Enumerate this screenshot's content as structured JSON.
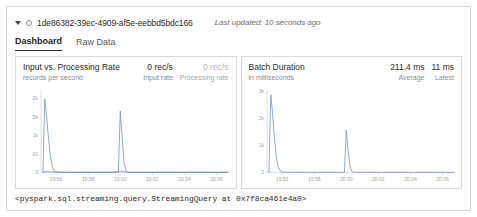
{
  "header": {
    "caret_icon": "chevron-down-icon",
    "status_icon": "status-circle-icon",
    "query_id": "1de86382-39ec-4909-af5e-eebbd5bdc166",
    "last_updated": "Last updated: 10 seconds ago"
  },
  "tabs": [
    {
      "label": "Dashboard",
      "active": true
    },
    {
      "label": "Raw Data",
      "active": false
    }
  ],
  "panels": [
    {
      "title": "Input vs. Processing Rate",
      "subtitle": "records per second",
      "stats": [
        {
          "value": "0 rec/s",
          "label": "Input rate",
          "muted": false
        },
        {
          "value": "0 rec/s",
          "label": "Processing rate",
          "muted": true
        }
      ]
    },
    {
      "title": "Batch Duration",
      "subtitle": "in milliseconds",
      "stats": [
        {
          "value": "211.4 ms",
          "label": "Average",
          "muted": false
        },
        {
          "value": "11 ms",
          "label": "Latest",
          "muted": false
        }
      ]
    }
  ],
  "repr": "<pyspark.sql.streaming.query.StreamingQuery at 0x7f8ca461e4a0>",
  "colors": {
    "input_rate_line": "#6f92c4",
    "processing_rate_line": "#c9ced6",
    "batch_duration_line": "#6f92c4",
    "axis": "#cfcfcf",
    "tick_text": "#a6a6a6",
    "card_border": "#d6d6d6",
    "active_tab_underline": "#2b2b2b"
  },
  "chart_data": [
    {
      "type": "line",
      "name": "input-vs-processing-rate-chart",
      "title": "Input vs. Processing Rate",
      "ylabel": "records per second",
      "xlabel": "",
      "grid": false,
      "legend": "none",
      "xlim": [
        0,
        100
      ],
      "ylim": [
        0,
        2200
      ],
      "xticks": [
        8,
        25,
        42,
        59,
        76,
        93
      ],
      "xticklabels": [
        "19:56",
        "19:58",
        "20:00",
        "20:02",
        "20:04",
        "20:06"
      ],
      "yticks": [
        0,
        500,
        1000,
        1500,
        2000
      ],
      "yticklabels": [
        "0",
        ".00",
        "1k",
        ".5k",
        "2k"
      ],
      "series": [
        {
          "name": "Input rate",
          "color": "#6f92c4",
          "x": [
            1,
            2,
            3,
            4,
            5,
            6,
            7,
            8,
            10,
            14,
            20,
            26,
            32,
            38,
            41,
            42,
            43,
            44,
            45,
            46,
            48,
            52,
            58,
            64,
            70,
            76,
            82,
            88,
            94,
            99
          ],
          "y": [
            0,
            1980,
            1480,
            900,
            430,
            150,
            40,
            8,
            0,
            0,
            0,
            0,
            0,
            0,
            0,
            1650,
            940,
            260,
            40,
            0,
            0,
            0,
            0,
            0,
            0,
            0,
            0,
            0,
            0,
            0
          ]
        },
        {
          "name": "Processing rate",
          "color": "#c9ced6",
          "x": [
            1,
            3,
            5,
            8,
            14,
            20,
            26,
            32,
            38,
            42,
            44,
            46,
            52,
            58,
            64,
            70,
            76,
            82,
            88,
            94,
            99
          ],
          "y": [
            0,
            20,
            12,
            4,
            0,
            0,
            0,
            0,
            0,
            30,
            14,
            0,
            0,
            0,
            0,
            0,
            0,
            0,
            0,
            0,
            0
          ]
        }
      ]
    },
    {
      "type": "line",
      "name": "batch-duration-chart",
      "title": "Batch Duration",
      "ylabel": "in milliseconds",
      "xlabel": "",
      "grid": false,
      "legend": "none",
      "xlim": [
        0,
        100
      ],
      "ylim": [
        0,
        3000
      ],
      "xticks": [
        8,
        25,
        42,
        59,
        76,
        93
      ],
      "xticklabels": [
        "19:56",
        "19:58",
        "20:00",
        "20:02",
        "20:04",
        "20:06"
      ],
      "yticks": [
        0,
        1000,
        2000,
        3000
      ],
      "yticklabels": [
        "0",
        "1k",
        "2k",
        "3k"
      ],
      "series": [
        {
          "name": "Batch duration",
          "color": "#6f92c4",
          "x": [
            1,
            2,
            3,
            4,
            5,
            6,
            7,
            8,
            10,
            14,
            20,
            26,
            32,
            38,
            41,
            42,
            43,
            44,
            45,
            46,
            48,
            52,
            58,
            64,
            70,
            76,
            82,
            88,
            94,
            99
          ],
          "y": [
            0,
            2850,
            2100,
            1200,
            520,
            180,
            60,
            15,
            0,
            0,
            0,
            0,
            0,
            0,
            0,
            1550,
            780,
            200,
            30,
            0,
            0,
            0,
            0,
            0,
            0,
            0,
            0,
            0,
            0,
            0
          ]
        }
      ]
    }
  ]
}
